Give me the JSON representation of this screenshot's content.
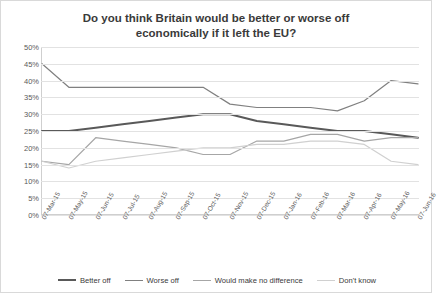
{
  "chart_data": {
    "type": "line",
    "title": "Do you think Britain would be better or worse off economically if it left the EU?",
    "xlabel": "",
    "ylabel": "",
    "ylim": [
      0,
      50
    ],
    "yticks": [
      0,
      5,
      10,
      15,
      20,
      25,
      30,
      35,
      40,
      45,
      50
    ],
    "ytick_labels": [
      "0%",
      "5%",
      "10%",
      "15%",
      "20%",
      "25%",
      "30%",
      "35%",
      "40%",
      "45%",
      "50%"
    ],
    "grid": true,
    "legend_position": "bottom",
    "categories": [
      "07-Mar-15",
      "07-May-15",
      "07-Jun-15",
      "07-Jul-15",
      "07-Aug-15",
      "07-Sep-15",
      "07-Oct-15",
      "07-Nov-15",
      "07-Dec-15",
      "07-Jan-16",
      "07-Feb-16",
      "07-Mar-16",
      "07-Apr-16",
      "07-May-16",
      "07-Jun-16"
    ],
    "series": [
      {
        "name": "Better off",
        "color": "#595959",
        "width": 2.0,
        "values": [
          25,
          25,
          26,
          27,
          28,
          29,
          30,
          30,
          28,
          27,
          26,
          25,
          25,
          24,
          23
        ]
      },
      {
        "name": "Worse off",
        "color": "#808080",
        "width": 1.2,
        "values": [
          45,
          38,
          38,
          38,
          38,
          38,
          38,
          33,
          32,
          32,
          32,
          31,
          34,
          40,
          39
        ]
      },
      {
        "name": "Would make no difference",
        "color": "#a6a6a6",
        "width": 1.2,
        "values": [
          16,
          15,
          23,
          22,
          21,
          20,
          18,
          18,
          22,
          22,
          24,
          24,
          22,
          23,
          23
        ]
      },
      {
        "name": "Don't know",
        "color": "#d0d0d0",
        "width": 1.2,
        "values": [
          16,
          14,
          16,
          17,
          18,
          19,
          20,
          20,
          21,
          21,
          22,
          22,
          21,
          16,
          15
        ]
      }
    ]
  }
}
